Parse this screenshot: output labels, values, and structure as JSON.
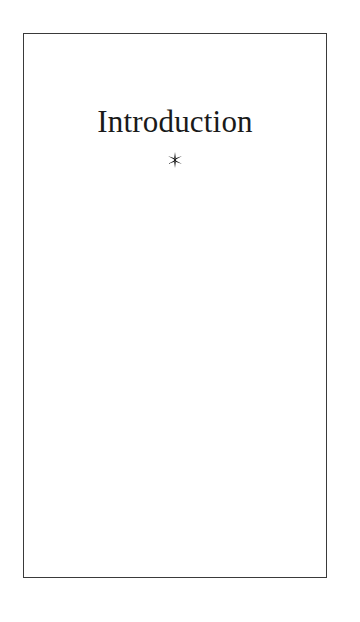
{
  "document": {
    "page_background_color": "#ffffff",
    "frame": {
      "border_color": "#3a3a3a",
      "fill_color": "#ffffff"
    }
  },
  "page": {
    "chapter_title": "Introduction",
    "ornament_glyph": "✳",
    "ornament_icon_name": "six-pointed-asterisk-ornament",
    "text_color": "#1a1a1a",
    "body_text": ""
  }
}
